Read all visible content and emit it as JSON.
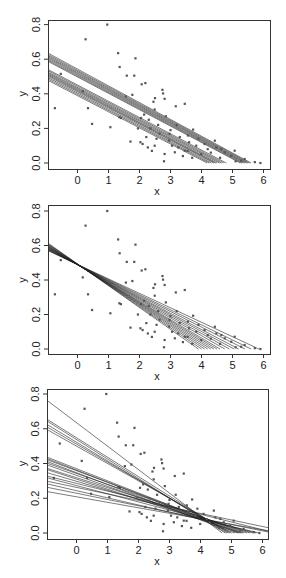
{
  "chart_data": [
    {
      "type": "scatter",
      "panel": "top",
      "title": "",
      "xlabel": "x",
      "ylabel": "y",
      "xlim": [
        -1,
        6.2
      ],
      "ylim": [
        -0.01,
        0.84
      ],
      "xticks": [
        "0",
        "1",
        "2",
        "3",
        "4",
        "5",
        "6"
      ],
      "yticks": [
        "0.0",
        "0.2",
        "0.4",
        "0.6",
        "0.8"
      ],
      "grid": false,
      "description": "Scatter of points with many overlaid parallel fitted regression lines in two bundles",
      "lines": [
        {
          "x0": -1,
          "y0": 0.64,
          "x1": 5.6,
          "y1": 0.0
        },
        {
          "x0": -1,
          "y0": 0.632,
          "x1": 5.55,
          "y1": 0.0
        },
        {
          "x0": -1,
          "y0": 0.625,
          "x1": 5.5,
          "y1": 0.0
        },
        {
          "x0": -1,
          "y0": 0.618,
          "x1": 5.45,
          "y1": 0.0
        },
        {
          "x0": -1,
          "y0": 0.612,
          "x1": 5.4,
          "y1": 0.0
        },
        {
          "x0": -1,
          "y0": 0.605,
          "x1": 5.35,
          "y1": 0.0
        },
        {
          "x0": -1,
          "y0": 0.598,
          "x1": 5.3,
          "y1": 0.0
        },
        {
          "x0": -1,
          "y0": 0.592,
          "x1": 5.25,
          "y1": 0.0
        },
        {
          "x0": -1,
          "y0": 0.545,
          "x1": 4.8,
          "y1": 0.0
        },
        {
          "x0": -1,
          "y0": 0.538,
          "x1": 4.72,
          "y1": 0.0
        },
        {
          "x0": -1,
          "y0": 0.53,
          "x1": 4.65,
          "y1": 0.0
        },
        {
          "x0": -1,
          "y0": 0.524,
          "x1": 4.58,
          "y1": 0.0
        },
        {
          "x0": -1,
          "y0": 0.518,
          "x1": 4.5,
          "y1": 0.0
        },
        {
          "x0": -1,
          "y0": 0.512,
          "x1": 4.45,
          "y1": 0.0
        },
        {
          "x0": -1,
          "y0": 0.506,
          "x1": 4.4,
          "y1": 0.0
        },
        {
          "x0": -1,
          "y0": 0.498,
          "x1": 4.32,
          "y1": 0.0
        },
        {
          "x0": -1,
          "y0": 0.49,
          "x1": 4.25,
          "y1": 0.0
        },
        {
          "x0": -1,
          "y0": 0.482,
          "x1": 4.18,
          "y1": 0.0
        }
      ]
    },
    {
      "type": "scatter",
      "panel": "middle",
      "title": "",
      "xlabel": "x",
      "ylabel": "y",
      "xlim": [
        -1,
        6.2
      ],
      "ylim": [
        -0.01,
        0.84
      ],
      "xticks": [
        "0",
        "1",
        "2",
        "3",
        "4",
        "5",
        "6"
      ],
      "yticks": [
        "0.0",
        "0.2",
        "0.4",
        "0.6",
        "0.8"
      ],
      "grid": false,
      "description": "Same scatter with fitted lines fanning out from a common pivot near (0, 0.49)",
      "lines": [
        {
          "x0": -1,
          "y0": 0.62,
          "x1": 3.9,
          "y1": 0.0
        },
        {
          "x0": -1,
          "y0": 0.615,
          "x1": 4.0,
          "y1": 0.0
        },
        {
          "x0": -1,
          "y0": 0.612,
          "x1": 4.1,
          "y1": 0.0
        },
        {
          "x0": -1,
          "y0": 0.608,
          "x1": 4.2,
          "y1": 0.0
        },
        {
          "x0": -1,
          "y0": 0.604,
          "x1": 4.3,
          "y1": 0.0
        },
        {
          "x0": -1,
          "y0": 0.601,
          "x1": 4.4,
          "y1": 0.0
        },
        {
          "x0": -1,
          "y0": 0.598,
          "x1": 4.5,
          "y1": 0.0
        },
        {
          "x0": -1,
          "y0": 0.595,
          "x1": 4.6,
          "y1": 0.0
        },
        {
          "x0": -1,
          "y0": 0.592,
          "x1": 4.75,
          "y1": 0.0
        },
        {
          "x0": -1,
          "y0": 0.589,
          "x1": 4.9,
          "y1": 0.0
        },
        {
          "x0": -1,
          "y0": 0.586,
          "x1": 5.05,
          "y1": 0.0
        },
        {
          "x0": -1,
          "y0": 0.583,
          "x1": 5.2,
          "y1": 0.0
        },
        {
          "x0": -1,
          "y0": 0.58,
          "x1": 5.4,
          "y1": 0.0
        },
        {
          "x0": -1,
          "y0": 0.577,
          "x1": 5.6,
          "y1": 0.0
        },
        {
          "x0": -1,
          "y0": 0.574,
          "x1": 5.85,
          "y1": 0.0
        }
      ]
    },
    {
      "type": "scatter",
      "panel": "bottom",
      "title": "",
      "xlabel": "x",
      "ylabel": "y",
      "xlim": [
        -1,
        6.2
      ],
      "ylim": [
        -0.01,
        0.84
      ],
      "xticks": [
        "0",
        "1",
        "2",
        "3",
        "4",
        "5",
        "6"
      ],
      "yticks": [
        "0.0",
        "0.2",
        "0.4",
        "0.6",
        "0.8"
      ],
      "grid": false,
      "description": "Same scatter with heterogeneous fitted lines of varying slopes and intercepts, converging near x=4",
      "lines": [
        {
          "x0": -1,
          "y0": 0.77,
          "x1": 4.7,
          "y1": 0.0
        },
        {
          "x0": -1,
          "y0": 0.66,
          "x1": 4.9,
          "y1": 0.0
        },
        {
          "x0": -1,
          "y0": 0.65,
          "x1": 4.8,
          "y1": 0.0
        },
        {
          "x0": -1,
          "y0": 0.63,
          "x1": 4.85,
          "y1": 0.0
        },
        {
          "x0": -1,
          "y0": 0.615,
          "x1": 4.95,
          "y1": 0.0
        },
        {
          "x0": -1,
          "y0": 0.6,
          "x1": 5.0,
          "y1": 0.0
        },
        {
          "x0": -1,
          "y0": 0.44,
          "x1": 5.3,
          "y1": 0.0
        },
        {
          "x0": -1,
          "y0": 0.432,
          "x1": 5.2,
          "y1": 0.0
        },
        {
          "x0": -1,
          "y0": 0.425,
          "x1": 5.4,
          "y1": 0.0
        },
        {
          "x0": -1,
          "y0": 0.415,
          "x1": 5.1,
          "y1": 0.0
        },
        {
          "x0": -1,
          "y0": 0.405,
          "x1": 5.5,
          "y1": 0.0
        },
        {
          "x0": -1,
          "y0": 0.395,
          "x1": 5.25,
          "y1": 0.0
        },
        {
          "x0": -1,
          "y0": 0.375,
          "x1": 5.6,
          "y1": 0.0
        },
        {
          "x0": -1,
          "y0": 0.368,
          "x1": 5.35,
          "y1": 0.0
        },
        {
          "x0": -1,
          "y0": 0.35,
          "x1": 5.7,
          "y1": 0.0
        },
        {
          "x0": -1,
          "y0": 0.33,
          "x1": 6.2,
          "y1": 0.01
        },
        {
          "x0": -1,
          "y0": 0.32,
          "x1": 5.8,
          "y1": 0.0
        },
        {
          "x0": -1,
          "y0": 0.3,
          "x1": 6.2,
          "y1": 0.03
        },
        {
          "x0": -1,
          "y0": 0.285,
          "x1": 5.9,
          "y1": 0.0
        },
        {
          "x0": -1,
          "y0": 0.265,
          "x1": 6.2,
          "y1": 0.005
        },
        {
          "x0": -1,
          "y0": 0.24,
          "x1": 6.2,
          "y1": 0.012
        }
      ]
    }
  ],
  "shared_points": [
    [
      0.96,
      0.8
    ],
    [
      0.26,
      0.715
    ],
    [
      1.31,
      0.635
    ],
    [
      1.87,
      0.605
    ],
    [
      1.36,
      0.555
    ],
    [
      1.59,
      0.505
    ],
    [
      1.83,
      0.505
    ],
    [
      -0.54,
      0.515
    ],
    [
      2.07,
      0.455
    ],
    [
      2.19,
      0.462
    ],
    [
      0.17,
      0.415
    ],
    [
      -0.73,
      0.317
    ],
    [
      0.34,
      0.317
    ],
    [
      0.47,
      0.226
    ],
    [
      1.06,
      0.207
    ],
    [
      2.74,
      0.423
    ],
    [
      2.76,
      0.402
    ],
    [
      2.5,
      0.375
    ],
    [
      2.45,
      0.354
    ],
    [
      2.81,
      0.371
    ],
    [
      1.56,
      0.385
    ],
    [
      1.77,
      0.394
    ],
    [
      2.49,
      0.309
    ],
    [
      2.85,
      0.27
    ],
    [
      3.17,
      0.328
    ],
    [
      3.46,
      0.342
    ],
    [
      3.73,
      0.193
    ],
    [
      3.2,
      0.22
    ],
    [
      4.43,
      0.129
    ],
    [
      5.72,
      0.005
    ],
    [
      5.9,
      0.0
    ],
    [
      1.71,
      0.124
    ],
    [
      2.03,
      0.12
    ],
    [
      2.22,
      0.15
    ],
    [
      2.49,
      0.1
    ],
    [
      2.4,
      0.07
    ],
    [
      2.79,
      0.01
    ],
    [
      2.81,
      0.052
    ],
    [
      3.14,
      0.062
    ],
    [
      3.46,
      0.071
    ],
    [
      3.83,
      0.1
    ],
    [
      3.99,
      0.052
    ],
    [
      4.64,
      0.081
    ],
    [
      4.96,
      0.042
    ],
    [
      5.28,
      0.013
    ],
    [
      4.75,
      0.062
    ],
    [
      2.27,
      0.09
    ],
    [
      2.97,
      0.168
    ],
    [
      3.56,
      0.159
    ],
    [
      4.1,
      0.11
    ],
    [
      4.48,
      0.09
    ],
    [
      5.07,
      0.071
    ],
    [
      5.39,
      0.023
    ],
    [
      2.05,
      0.26
    ],
    [
      2.3,
      0.25
    ],
    [
      2.6,
      0.22
    ],
    [
      3.0,
      0.19
    ],
    [
      3.3,
      0.15
    ],
    [
      3.6,
      0.12
    ],
    [
      3.9,
      0.14
    ],
    [
      4.2,
      0.08
    ],
    [
      2.1,
      0.11
    ],
    [
      2.55,
      0.14
    ],
    [
      3.05,
      0.1
    ],
    [
      3.4,
      0.04
    ],
    [
      3.7,
      0.03
    ],
    [
      4.3,
      0.06
    ],
    [
      4.6,
      0.03
    ],
    [
      5.1,
      0.01
    ],
    [
      2.35,
      0.2
    ],
    [
      2.65,
      0.17
    ],
    [
      2.95,
      0.13
    ],
    [
      3.25,
      0.09
    ],
    [
      3.55,
      0.07
    ],
    [
      1.4,
      0.26
    ],
    [
      1.35,
      0.265
    ],
    [
      2.15,
      0.28
    ],
    [
      1.95,
      0.2
    ]
  ],
  "axes_labels": {
    "x": "x",
    "y": "y",
    "xticks": [
      "0",
      "1",
      "2",
      "3",
      "4",
      "5",
      "6"
    ],
    "yticks": [
      "0.0",
      "0.2",
      "0.4",
      "0.6",
      "0.8"
    ]
  },
  "colors": {
    "points": "#555555",
    "lines": "#222222",
    "frame": "#333333",
    "background": "#ffffff"
  }
}
